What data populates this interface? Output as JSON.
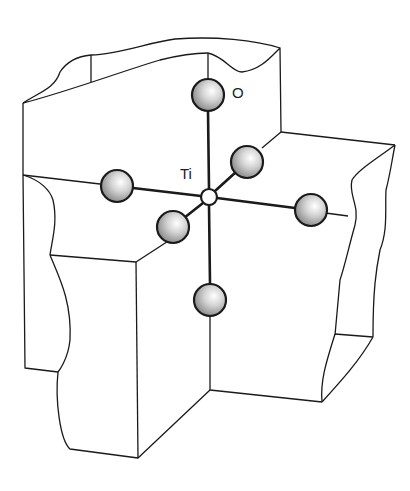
{
  "diagram": {
    "labels": {
      "oxygen": "O",
      "titanium": "Ti"
    },
    "atoms": [
      {
        "element": "O",
        "position": "top"
      },
      {
        "element": "O",
        "position": "left"
      },
      {
        "element": "O",
        "position": "right"
      },
      {
        "element": "O",
        "position": "back"
      },
      {
        "element": "O",
        "position": "front"
      },
      {
        "element": "O",
        "position": "bottom"
      },
      {
        "element": "Ti",
        "position": "center"
      }
    ],
    "colors": {
      "line": "#1a1a1a",
      "sphere_fill": "#c8c8c8",
      "background": "#ffffff"
    }
  }
}
